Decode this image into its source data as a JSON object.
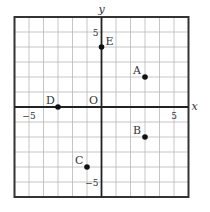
{
  "diagram": {
    "type": "coordinate-plane",
    "x_axis_label": "x",
    "y_axis_label": "y",
    "origin_label": "O",
    "range": {
      "xmin": -6,
      "xmax": 6,
      "ymin": -6,
      "ymax": 6
    },
    "ticks": {
      "x_neg": "−5",
      "x_pos": "5",
      "y_pos": "5",
      "y_neg": "−5"
    },
    "points": [
      {
        "label": "A",
        "x": 3,
        "y": 2
      },
      {
        "label": "B",
        "x": 3,
        "y": -2
      },
      {
        "label": "C",
        "x": -1,
        "y": -4
      },
      {
        "label": "D",
        "x": -3,
        "y": 0
      },
      {
        "label": "E",
        "x": 0,
        "y": 4
      }
    ],
    "colors": {
      "grid": "#b8b8b8",
      "axis": "#222222",
      "border": "#333333",
      "point": "#111111"
    }
  }
}
